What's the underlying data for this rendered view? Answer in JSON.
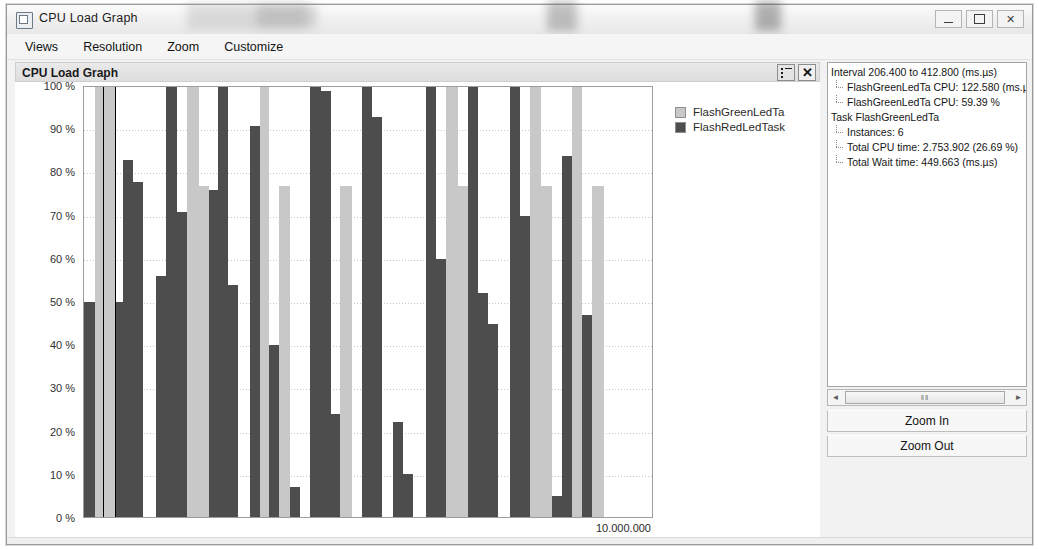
{
  "window": {
    "title": "CPU Load Graph",
    "app_icon": "window-icon",
    "controls": {
      "minimize": "minimize-icon",
      "maximize": "maximize-icon",
      "close": "close-icon"
    }
  },
  "menubar": {
    "items": [
      "Views",
      "Resolution",
      "Zoom",
      "Customize"
    ]
  },
  "chart_pane": {
    "title": "CPU Load Graph",
    "buttons": {
      "legend_toggle": "list-icon",
      "close": "✕"
    }
  },
  "legend": {
    "entries": [
      {
        "label": "FlashGreenLedTa",
        "color": "#c8c8c8"
      },
      {
        "label": "FlashRedLedTask",
        "color": "#4d4d4d"
      }
    ]
  },
  "info_panel": {
    "rows": [
      {
        "text": "Interval 206.400 to 412.800 (ms.µs)",
        "level": 0
      },
      {
        "text": "FlashGreenLedTa CPU: 122.580 (ms.µ",
        "level": 1
      },
      {
        "text": "FlashGreenLedTa CPU: 59.39 %",
        "level": 1
      },
      {
        "text": "Task FlashGreenLedTa",
        "level": 0
      },
      {
        "text": "Instances: 6",
        "level": 1
      },
      {
        "text": "Total CPU time: 2.753.902 (26.69 %)",
        "level": 1
      },
      {
        "text": "Total Wait time: 449.663 (ms.µs)",
        "level": 1
      }
    ],
    "scrollbar": {
      "left_arrow": "◄",
      "right_arrow": "►",
      "grip": "‖‖"
    },
    "zoom_in_label": "Zoom In",
    "zoom_out_label": "Zoom Out"
  },
  "chart_data": {
    "type": "bar",
    "title": "CPU Load Graph",
    "xlabel": "10.000.000",
    "ylabel": "",
    "ylim": [
      0,
      100
    ],
    "grid": true,
    "legend_position": "right",
    "yticks": [
      "100 %",
      "90 %",
      "80 %",
      "70 %",
      "60 %",
      "50 %",
      "40 %",
      "30 %",
      "20 %",
      "10 %",
      "0 %"
    ],
    "ytick_values": [
      100,
      90,
      80,
      70,
      60,
      50,
      40,
      30,
      20,
      10,
      0
    ],
    "xaxis_end_label": "10.000.000",
    "selected_bar_index": 2,
    "series": [
      {
        "name": "FlashGreenLedTa",
        "color": "#c8c8c8"
      },
      {
        "name": "FlashRedLedTask",
        "color": "#4d4d4d"
      }
    ],
    "bars": [
      {
        "series": "FlashRedLedTask",
        "value": 50,
        "width": 11
      },
      {
        "series": "FlashGreenLedTa",
        "value": 100,
        "width": 9
      },
      {
        "series": "FlashGreenLedTa",
        "value": 100,
        "width": 11,
        "selected": true
      },
      {
        "series": "FlashRedLedTask",
        "value": 50,
        "width": 8
      },
      {
        "series": "FlashRedLedTask",
        "value": 83,
        "width": 10
      },
      {
        "series": "FlashRedLedTask",
        "value": 78,
        "width": 10
      },
      {
        "series": "FlashGreenLedTa",
        "value": 0,
        "width": 13
      },
      {
        "series": "FlashRedLedTask",
        "value": 56,
        "width": 10
      },
      {
        "series": "FlashRedLedTask",
        "value": 100,
        "width": 11
      },
      {
        "series": "FlashRedLedTask",
        "value": 71,
        "width": 10
      },
      {
        "series": "FlashGreenLedTa",
        "value": 100,
        "width": 12
      },
      {
        "series": "FlashGreenLedTa",
        "value": 77,
        "width": 10
      },
      {
        "series": "FlashRedLedTask",
        "value": 76,
        "width": 9
      },
      {
        "series": "FlashRedLedTask",
        "value": 100,
        "width": 10
      },
      {
        "series": "FlashRedLedTask",
        "value": 54,
        "width": 10
      },
      {
        "series": "FlashGreenLedTa",
        "value": 0,
        "width": 12
      },
      {
        "series": "FlashRedLedTask",
        "value": 91,
        "width": 10
      },
      {
        "series": "FlashGreenLedTa",
        "value": 100,
        "width": 9
      },
      {
        "series": "FlashRedLedTask",
        "value": 40,
        "width": 10
      },
      {
        "series": "FlashGreenLedTa",
        "value": 77,
        "width": 11
      },
      {
        "series": "FlashRedLedTask",
        "value": 7,
        "width": 10
      },
      {
        "series": "FlashGreenLedTa",
        "value": 0,
        "width": 10
      },
      {
        "series": "FlashRedLedTask",
        "value": 100,
        "width": 11
      },
      {
        "series": "FlashRedLedTask",
        "value": 99,
        "width": 10
      },
      {
        "series": "FlashRedLedTask",
        "value": 24,
        "width": 9
      },
      {
        "series": "FlashGreenLedTa",
        "value": 77,
        "width": 12
      },
      {
        "series": "FlashGreenLedTa",
        "value": 0,
        "width": 10
      },
      {
        "series": "FlashRedLedTask",
        "value": 100,
        "width": 10
      },
      {
        "series": "FlashRedLedTask",
        "value": 93,
        "width": 10
      },
      {
        "series": "FlashGreenLedTa",
        "value": 0,
        "width": 11
      },
      {
        "series": "FlashRedLedTask",
        "value": 22,
        "width": 10
      },
      {
        "series": "FlashRedLedTask",
        "value": 10,
        "width": 10
      },
      {
        "series": "FlashGreenLedTa",
        "value": 0,
        "width": 13
      },
      {
        "series": "FlashRedLedTask",
        "value": 100,
        "width": 10
      },
      {
        "series": "FlashRedLedTask",
        "value": 60,
        "width": 10
      },
      {
        "series": "FlashGreenLedTa",
        "value": 100,
        "width": 12
      },
      {
        "series": "FlashGreenLedTa",
        "value": 77,
        "width": 10
      },
      {
        "series": "FlashRedLedTask",
        "value": 100,
        "width": 10
      },
      {
        "series": "FlashRedLedTask",
        "value": 52,
        "width": 10
      },
      {
        "series": "FlashRedLedTask",
        "value": 45,
        "width": 10
      },
      {
        "series": "FlashGreenLedTa",
        "value": 0,
        "width": 12
      },
      {
        "series": "FlashRedLedTask",
        "value": 100,
        "width": 10
      },
      {
        "series": "FlashRedLedTask",
        "value": 70,
        "width": 10
      },
      {
        "series": "FlashGreenLedTa",
        "value": 100,
        "width": 11
      },
      {
        "series": "FlashGreenLedTa",
        "value": 77,
        "width": 11
      },
      {
        "series": "FlashRedLedTask",
        "value": 5,
        "width": 10
      },
      {
        "series": "FlashRedLedTask",
        "value": 84,
        "width": 10
      },
      {
        "series": "FlashGreenLedTa",
        "value": 100,
        "width": 10
      },
      {
        "series": "FlashRedLedTask",
        "value": 47,
        "width": 10
      },
      {
        "series": "FlashGreenLedTa",
        "value": 77,
        "width": 12
      }
    ]
  }
}
